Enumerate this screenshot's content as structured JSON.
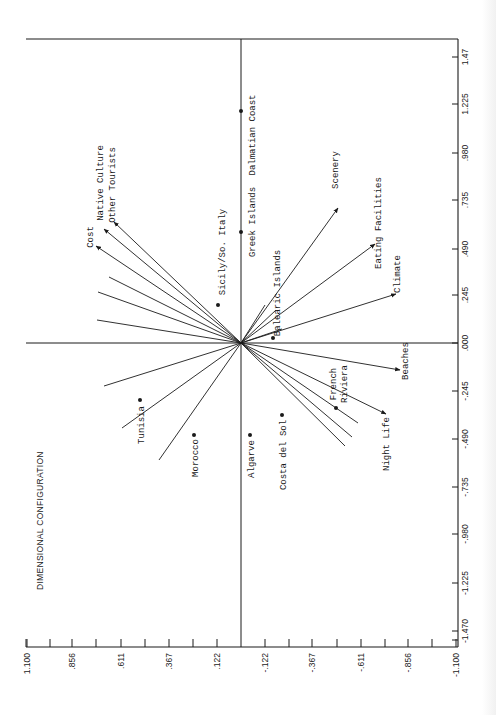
{
  "chart_data": {
    "type": "scatter",
    "title": "DIMENSIONAL CONFIGURATION",
    "orientation": "rotated 90 degrees counter-clockwise",
    "xlabel": "",
    "ylabel": "",
    "axis_right": {
      "ticks": [
        "1.47",
        "1.225",
        ".980",
        ".735",
        ".490",
        ".245",
        ".000",
        "-.245",
        "-.490",
        "-.735",
        "-.980",
        "-1.225",
        "-1.470"
      ],
      "range": [
        -1.47,
        1.47
      ]
    },
    "axis_bottom": {
      "ticks": [
        "1.100",
        ".856",
        ".611",
        ".367",
        ".122",
        "-.122",
        "-.367",
        "-.611",
        "-.856",
        "-1.100"
      ],
      "range": [
        1.1,
        -1.1
      ]
    },
    "points": [
      {
        "label": "Dalmatian Coast",
        "dim1": 1.22,
        "dim2": 0.0
      },
      {
        "label": "Greek Islands",
        "dim1": 0.58,
        "dim2": 0.0
      },
      {
        "label": "Sicily/So. Italy",
        "dim1": 0.2,
        "dim2": 0.11
      },
      {
        "label": "Balearic Islands",
        "dim1": 0.03,
        "dim2": -0.16
      },
      {
        "label": "Tunisia",
        "dim1": -0.3,
        "dim2": 0.51
      },
      {
        "label": "Morocco",
        "dim1": -0.48,
        "dim2": 0.24
      },
      {
        "label": "Algarve",
        "dim1": -0.48,
        "dim2": -0.05
      },
      {
        "label": "Costa del Sol",
        "dim1": -0.38,
        "dim2": -0.21
      },
      {
        "label": "French Riviera",
        "dim1": -0.34,
        "dim2": -0.48
      }
    ],
    "vectors": [
      {
        "label": "Cost",
        "dim1": 0.51,
        "dim2": 0.73
      },
      {
        "label": "Native Culture",
        "dim1": 0.6,
        "dim2": 0.69
      },
      {
        "label": "Other Tourists",
        "dim1": 0.64,
        "dim2": 0.64
      },
      {
        "label": "Scenery",
        "dim1": 0.71,
        "dim2": -0.49
      },
      {
        "label": "Eating Facilities",
        "dim1": 0.52,
        "dim2": -0.68
      },
      {
        "label": "Climate",
        "dim1": 0.26,
        "dim2": -0.78
      },
      {
        "label": "Beaches",
        "dim1": -0.14,
        "dim2": -0.8
      },
      {
        "label": "Night Life",
        "dim1": -0.37,
        "dim2": -0.73
      }
    ],
    "unlabeled_vectors": [
      {
        "dim1": 0.27,
        "dim2": 0.72
      },
      {
        "dim1": 0.35,
        "dim2": 0.67
      },
      {
        "dim1": 0.12,
        "dim2": 0.73
      },
      {
        "dim1": -0.29,
        "dim2": 0.64
      },
      {
        "dim1": -0.44,
        "dim2": 0.61
      },
      {
        "dim1": -0.64,
        "dim2": 0.42
      },
      {
        "dim1": -0.42,
        "dim2": -0.6
      },
      {
        "dim1": -0.48,
        "dim2": -0.57
      },
      {
        "dim1": -0.53,
        "dim2": -0.53
      }
    ],
    "grid": false,
    "legend": "none"
  },
  "page": {
    "title": "DIMENSIONAL CONFIGURATION",
    "header_fragment": "(Cont'd.)"
  },
  "plot": {
    "frame": {
      "left": 26,
      "top": 39,
      "right": 458,
      "bottom": 647
    },
    "origin": {
      "x": 241,
      "y": 343
    },
    "right_ticks": [
      {
        "label": "1.47",
        "y": 57
      },
      {
        "label": "1.225",
        "y": 104
      },
      {
        "label": ".980",
        "y": 153
      },
      {
        "label": ".735",
        "y": 200
      },
      {
        "label": ".490",
        "y": 249
      },
      {
        "label": ".245",
        "y": 295
      },
      {
        "label": ".000",
        "y": 343
      },
      {
        "label": "-.245",
        "y": 391
      },
      {
        "label": "-.490",
        "y": 439
      },
      {
        "label": "-.735",
        "y": 487
      },
      {
        "label": "-.980",
        "y": 534
      },
      {
        "label": "-1.225",
        "y": 583
      },
      {
        "label": "-1.470",
        "y": 631
      }
    ],
    "bottom_ticks": [
      {
        "label": "1.100",
        "x": 27,
        "major": true
      },
      {
        "label": "",
        "x": 50,
        "major": false
      },
      {
        "label": ".856",
        "x": 72,
        "major": true
      },
      {
        "label": "",
        "x": 96,
        "major": false
      },
      {
        "label": ".611",
        "x": 121,
        "major": true
      },
      {
        "label": "",
        "x": 145,
        "major": false
      },
      {
        "label": ".367",
        "x": 169,
        "major": true
      },
      {
        "label": "",
        "x": 193,
        "major": false
      },
      {
        "label": ".122",
        "x": 217,
        "major": true
      },
      {
        "label": "-.122",
        "x": 265,
        "major": true
      },
      {
        "label": "",
        "x": 289,
        "major": false
      },
      {
        "label": "-.367",
        "x": 312,
        "major": true
      },
      {
        "label": "",
        "x": 337,
        "major": false
      },
      {
        "label": "-.611",
        "x": 361,
        "major": true
      },
      {
        "label": "",
        "x": 385,
        "major": false
      },
      {
        "label": "-.856",
        "x": 408,
        "major": true
      },
      {
        "label": "",
        "x": 432,
        "major": false
      },
      {
        "label": "-1.100",
        "x": 456,
        "major": true
      }
    ],
    "points": [
      {
        "label": "Dalmatian Coast",
        "x": 241,
        "y": 111,
        "lx": 252,
        "ly": 135,
        "anchor": "middle"
      },
      {
        "label": "Greek Islands",
        "x": 241,
        "y": 232,
        "lx": 252,
        "ly": 222,
        "anchor": "middle"
      },
      {
        "label": "Sicily/So. Italy",
        "x": 218,
        "y": 305,
        "lx": 222,
        "ly": 252,
        "anchor": "middle"
      },
      {
        "label": "Balearic Islands",
        "x": 273,
        "y": 338,
        "lx": 277,
        "ly": 293,
        "anchor": "middle"
      },
      {
        "label": "Tunisia",
        "x": 140,
        "y": 400,
        "lx": 141,
        "ly": 425,
        "anchor": "middle"
      },
      {
        "label": "Morocco",
        "x": 194,
        "y": 435,
        "lx": 195,
        "ly": 458,
        "anchor": "middle"
      },
      {
        "label": "Algarve",
        "x": 250,
        "y": 435,
        "lx": 251,
        "ly": 459,
        "anchor": "middle"
      },
      {
        "label": "Costa del Sol",
        "x": 282,
        "y": 415,
        "lx": 283,
        "ly": 455,
        "anchor": "middle"
      },
      {
        "label": "French Riviera",
        "x": 336,
        "y": 408,
        "lx": 339,
        "ly": 384,
        "anchor": "middle"
      }
    ],
    "vectors": [
      {
        "label": "Cost",
        "x": 96,
        "y": 246,
        "lx": 93,
        "ly": 237,
        "arrow": true
      },
      {
        "label": "Native Culture",
        "x": 104,
        "y": 229,
        "lx": 103,
        "ly": 183,
        "arrow": true
      },
      {
        "label": "Other Tourists",
        "x": 114,
        "y": 222,
        "lx": 115,
        "ly": 185,
        "arrow": true
      },
      {
        "label": "Scenery",
        "x": 338,
        "y": 208,
        "lx": 338,
        "ly": 170,
        "arrow": true
      },
      {
        "label": "Eating Facilities",
        "x": 375,
        "y": 244,
        "lx": 381,
        "ly": 223,
        "arrow": true
      },
      {
        "label": "Climate",
        "x": 396,
        "y": 294,
        "lx": 400,
        "ly": 274,
        "arrow": true
      },
      {
        "label": "Beaches",
        "x": 400,
        "y": 370,
        "lx": 408,
        "ly": 361,
        "arrow": true
      },
      {
        "label": "Night Life",
        "x": 386,
        "y": 414,
        "lx": 389,
        "ly": 444,
        "arrow": true
      },
      {
        "label": "",
        "x": 98,
        "y": 292,
        "arrow": false
      },
      {
        "label": "",
        "x": 109,
        "y": 277,
        "arrow": false
      },
      {
        "label": "",
        "x": 97,
        "y": 320,
        "arrow": false
      },
      {
        "label": "",
        "x": 104,
        "y": 386,
        "arrow": false
      },
      {
        "label": "",
        "x": 122,
        "y": 428,
        "arrow": false
      },
      {
        "label": "",
        "x": 159,
        "y": 460,
        "arrow": false
      },
      {
        "label": "",
        "x": 358,
        "y": 423,
        "arrow": false
      },
      {
        "label": "",
        "x": 352,
        "y": 437,
        "arrow": false
      },
      {
        "label": "",
        "x": 345,
        "y": 446,
        "arrow": false
      },
      {
        "label": "",
        "x": 265,
        "y": 305,
        "arrow": false
      },
      {
        "label": "",
        "x": 276,
        "y": 310,
        "arrow": false
      },
      {
        "label": "",
        "x": 282,
        "y": 329,
        "arrow": false
      }
    ]
  }
}
